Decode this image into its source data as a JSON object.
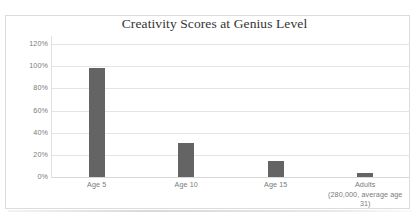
{
  "chart_data": {
    "type": "bar",
    "title": "Creativity Scores at Genius Level",
    "xlabel": "",
    "ylabel": "",
    "categories": [
      "Age 5",
      "Age 10",
      "Age 15",
      "Adults (280,000, average age 31)"
    ],
    "category_lines": [
      [
        "Age 5"
      ],
      [
        "Age 10"
      ],
      [
        "Age 15"
      ],
      [
        "Adults",
        "(280,000, average age",
        "31)"
      ]
    ],
    "values": [
      98,
      31,
      14,
      4
    ],
    "value_labels": [
      "98%",
      "31%",
      "14%",
      "4%"
    ],
    "ylim": [
      0,
      120
    ],
    "ytick_values": [
      120,
      100,
      80,
      60,
      40,
      20,
      0
    ],
    "ytick_labels": [
      "120%",
      "100%",
      "80%",
      "60%",
      "40%",
      "20%",
      "0%"
    ],
    "grid": true,
    "legend": false,
    "legend_position": "none",
    "series": [
      {
        "name": "Creativity Score",
        "values": [
          98,
          31,
          14,
          4
        ]
      }
    ]
  },
  "style": {
    "bar_color": "#646464",
    "gridline_color": "#e4e4e4",
    "axis_color": "#dfdfdf",
    "tick_label_color": "#7a7a7a",
    "title_color": "#333333",
    "frame_border_color": "#dcdcdc",
    "plot_background": "#ffffff"
  }
}
